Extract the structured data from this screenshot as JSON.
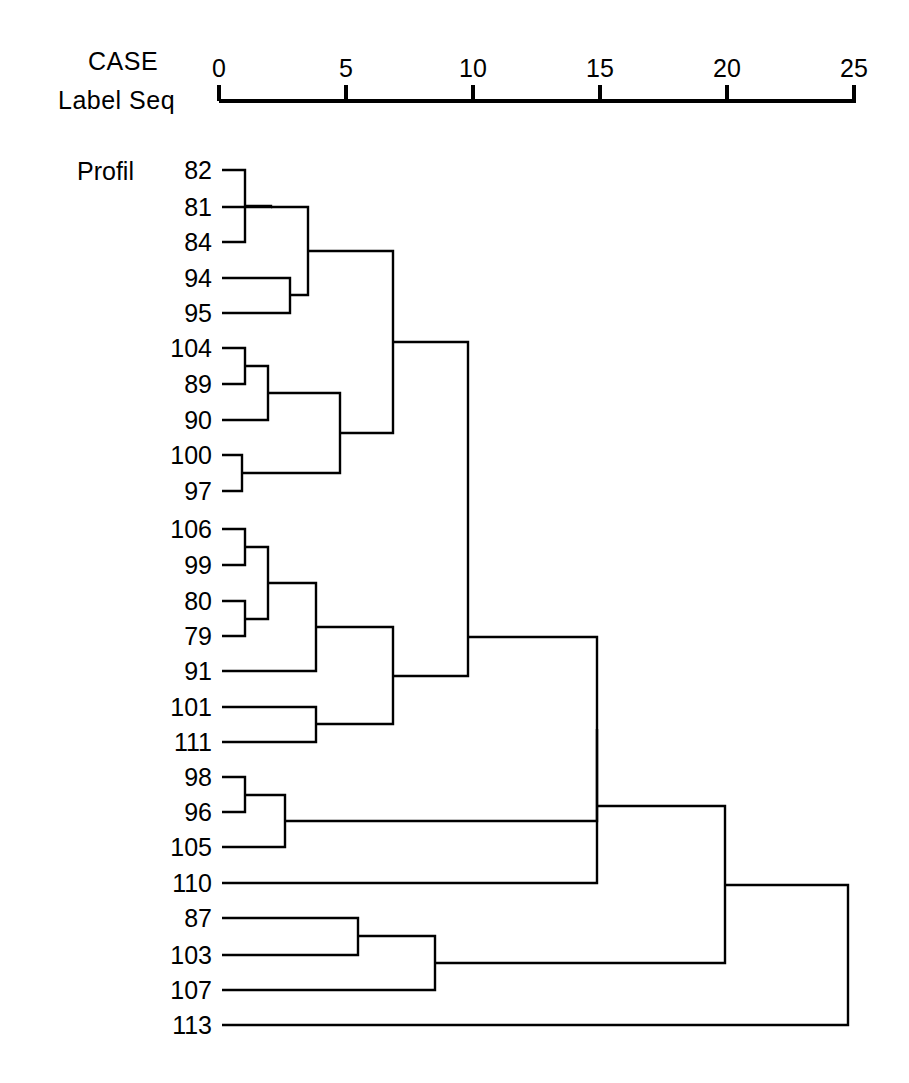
{
  "header": {
    "line1": "CASE",
    "line2": "Label Seq",
    "group_label": "Profil"
  },
  "axis": {
    "ticks": [
      0,
      5,
      10,
      15,
      20,
      25
    ],
    "tick_labels": [
      "0",
      "5",
      "10",
      "15",
      "20",
      "25"
    ],
    "x0_px": 219,
    "px_per_unit": 25.4,
    "y_px": 101,
    "range": [
      0,
      25
    ]
  },
  "colors": {
    "ink": "#000000",
    "paper": "#ffffff"
  },
  "chart_data": {
    "type": "dendrogram",
    "title": "",
    "xlabel": "Rescaled Distance Cluster Combine",
    "ylabel": "",
    "xlim": [
      0,
      25
    ],
    "grid": false,
    "legend": "none",
    "orientation": "horizontal",
    "leaf_order": [
      "82",
      "81",
      "84",
      "94",
      "95",
      "104",
      "89",
      "90",
      "100",
      "97",
      "106",
      "99",
      "80",
      "79",
      "91",
      "101",
      "111",
      "98",
      "96",
      "105",
      "110",
      "87",
      "103",
      "107",
      "113"
    ],
    "leaf_rows": [
      {
        "label": "82",
        "y": 170
      },
      {
        "label": "81",
        "y": 207
      },
      {
        "label": "84",
        "y": 242
      },
      {
        "label": "94",
        "y": 278
      },
      {
        "label": "95",
        "y": 313
      },
      {
        "label": "104",
        "y": 348
      },
      {
        "label": "89",
        "y": 384
      },
      {
        "label": "90",
        "y": 420
      },
      {
        "label": "100",
        "y": 455
      },
      {
        "label": "97",
        "y": 491
      },
      {
        "label": "106",
        "y": 529
      },
      {
        "label": "99",
        "y": 565
      },
      {
        "label": "80",
        "y": 601
      },
      {
        "label": "79",
        "y": 636
      },
      {
        "label": "91",
        "y": 671
      },
      {
        "label": "101",
        "y": 707
      },
      {
        "label": "111",
        "y": 742
      },
      {
        "label": "98",
        "y": 777
      },
      {
        "label": "96",
        "y": 812
      },
      {
        "label": "105",
        "y": 847
      },
      {
        "label": "110",
        "y": 883
      },
      {
        "label": "87",
        "y": 918
      },
      {
        "label": "103",
        "y": 955
      },
      {
        "label": "107",
        "y": 990
      },
      {
        "label": "113",
        "y": 1025
      }
    ],
    "merges": [
      {
        "id": "m1",
        "children": [
          "82",
          "84"
        ],
        "x": 245,
        "y": 206,
        "c1y": 170,
        "c2y": 242
      },
      {
        "id": "m2",
        "children": [
          "m1",
          "81"
        ],
        "x": 271,
        "y": 207,
        "c1y": 206,
        "c2y": 207,
        "c1x": 245
      },
      {
        "id": "m3",
        "children": [
          "94",
          "95"
        ],
        "x": 290,
        "y": 295,
        "c1y": 278,
        "c2y": 313
      },
      {
        "id": "m4",
        "children": [
          "m2",
          "m3"
        ],
        "x": 308,
        "y": 251,
        "c1y": 207,
        "c2y": 295,
        "c1x": 271,
        "c2x": 290
      },
      {
        "id": "m5",
        "children": [
          "104",
          "89"
        ],
        "x": 245,
        "y": 366,
        "c1y": 348,
        "c2y": 384
      },
      {
        "id": "m6",
        "children": [
          "m5",
          "90"
        ],
        "x": 268,
        "y": 393,
        "c1y": 366,
        "c2y": 420,
        "c1x": 245
      },
      {
        "id": "m7",
        "children": [
          "100",
          "97"
        ],
        "x": 242,
        "y": 473,
        "c1y": 455,
        "c2y": 491
      },
      {
        "id": "m8",
        "children": [
          "m6",
          "m7"
        ],
        "x": 340,
        "y": 433,
        "c1y": 393,
        "c2y": 473,
        "c1x": 268,
        "c2x": 242
      },
      {
        "id": "m9",
        "children": [
          "m4",
          "m8"
        ],
        "x": 393,
        "y": 342,
        "c1y": 251,
        "c2y": 433,
        "c1x": 308,
        "c2x": 340
      },
      {
        "id": "m10",
        "children": [
          "106",
          "99"
        ],
        "x": 245,
        "y": 547,
        "c1y": 529,
        "c2y": 565
      },
      {
        "id": "m11",
        "children": [
          "80",
          "79"
        ],
        "x": 245,
        "y": 619,
        "c1y": 601,
        "c2y": 636
      },
      {
        "id": "m12",
        "children": [
          "m10",
          "m11"
        ],
        "x": 268,
        "y": 583,
        "c1y": 547,
        "c2y": 619,
        "c1x": 245,
        "c2x": 245
      },
      {
        "id": "m13",
        "children": [
          "m12",
          "91"
        ],
        "x": 316,
        "y": 627,
        "c1y": 583,
        "c2y": 671,
        "c1x": 268
      },
      {
        "id": "m14",
        "children": [
          "101",
          "111"
        ],
        "x": 316,
        "y": 724,
        "c1y": 707,
        "c2y": 742
      },
      {
        "id": "m15",
        "children": [
          "m13",
          "m14"
        ],
        "x": 393,
        "y": 676,
        "c1y": 627,
        "c2y": 724,
        "c1x": 316,
        "c2x": 316
      },
      {
        "id": "m16",
        "children": [
          "m9",
          "m15"
        ],
        "x": 468,
        "y": 637,
        "c1y": 342,
        "c2y": 676,
        "c1x": 393,
        "c2x": 393
      },
      {
        "id": "m17",
        "children": [
          "98",
          "96"
        ],
        "x": 245,
        "y": 795,
        "c1y": 777,
        "c2y": 812
      },
      {
        "id": "m18",
        "children": [
          "m17",
          "105"
        ],
        "x": 285,
        "y": 821,
        "c1y": 795,
        "c2y": 847,
        "c1x": 245
      },
      {
        "id": "m19",
        "children": [
          "m16",
          "m18"
        ],
        "x": 597,
        "y": 729,
        "c1y": 637,
        "c2y": 821,
        "c1x": 468,
        "c2x": 285
      },
      {
        "id": "m20",
        "children": [
          "m19",
          "110"
        ],
        "x": 597,
        "y": 806,
        "c1y": 729,
        "c2y": 883,
        "c1x": 597
      },
      {
        "id": "m21",
        "children": [
          "87",
          "103"
        ],
        "x": 358,
        "y": 936,
        "c1y": 918,
        "c2y": 955
      },
      {
        "id": "m22",
        "children": [
          "m21",
          "107"
        ],
        "x": 435,
        "y": 963,
        "c1y": 936,
        "c2y": 990,
        "c1x": 358
      },
      {
        "id": "m23",
        "children": [
          "m20",
          "m22"
        ],
        "x": 725,
        "y": 885,
        "c1y": 806,
        "c2y": 963,
        "c1x": 597,
        "c2x": 435
      },
      {
        "id": "m24",
        "children": [
          "m23",
          "113"
        ],
        "x": 848,
        "y": 953,
        "c1y": 885,
        "c2y": 1025,
        "c1x": 725
      }
    ],
    "merge_distances": {
      "m1": 1.0,
      "m2": 2.0,
      "m3": 2.8,
      "m4": 3.5,
      "m5": 1.0,
      "m6": 1.9,
      "m7": 0.9,
      "m8": 4.8,
      "m9": 6.9,
      "m10": 1.0,
      "m11": 1.0,
      "m12": 1.9,
      "m13": 3.8,
      "m14": 3.8,
      "m15": 6.9,
      "m16": 9.8,
      "m17": 1.0,
      "m18": 2.6,
      "m19": 14.9,
      "m20": 14.9,
      "m21": 5.5,
      "m22": 8.5,
      "m23": 19.9,
      "m24": 24.8
    }
  }
}
